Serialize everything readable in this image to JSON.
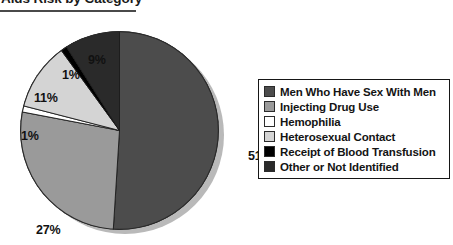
{
  "title": {
    "text": "Aids Risk by Category"
  },
  "chart_data": {
    "type": "pie",
    "title": "Aids Risk by Category",
    "xlabel": "",
    "ylabel": "",
    "legend_position": "right",
    "grid": false,
    "categories": [
      "Men Who Have Sex With Men",
      "Injecting Drug Use",
      "Hemophilia",
      "Heterosexual Contact",
      "Receipt of Blood Transfusion",
      "Other or Not Identified"
    ],
    "values": [
      51,
      27,
      1,
      11,
      1,
      9
    ],
    "value_labels": [
      "51%",
      "27%",
      "1%",
      "11%",
      "1%",
      "9%"
    ],
    "colors": [
      "#4c4c4c",
      "#9a9a9a",
      "#ffffff",
      "#d4d4d4",
      "#000000",
      "#2a2a2a"
    ],
    "slices": [
      {
        "label": "Men Who Have Sex With Men",
        "value": 51,
        "display": "51%",
        "color": "#4c4c4c"
      },
      {
        "label": "Injecting Drug Use",
        "value": 27,
        "display": "27%",
        "color": "#9a9a9a"
      },
      {
        "label": "Hemophilia",
        "value": 1,
        "display": "1%",
        "color": "#ffffff"
      },
      {
        "label": "Heterosexual Contact",
        "value": 11,
        "display": "11%",
        "color": "#d4d4d4"
      },
      {
        "label": "Receipt of Blood Transfusion",
        "value": 1,
        "display": "1%",
        "color": "#000000"
      },
      {
        "label": "Other or Not Identified",
        "value": 9,
        "display": "9%",
        "color": "#2a2a2a"
      }
    ]
  },
  "legend": {
    "items": [
      {
        "label": "Men Who Have Sex With Men",
        "color": "#4c4c4c"
      },
      {
        "label": "Injecting Drug Use",
        "color": "#9a9a9a"
      },
      {
        "label": "Hemophilia",
        "color": "#ffffff"
      },
      {
        "label": "Heterosexual Contact",
        "color": "#d4d4d4"
      },
      {
        "label": "Receipt of Blood Transfusion",
        "color": "#000000"
      },
      {
        "label": "Other or Not Identified",
        "color": "#2a2a2a"
      }
    ]
  }
}
